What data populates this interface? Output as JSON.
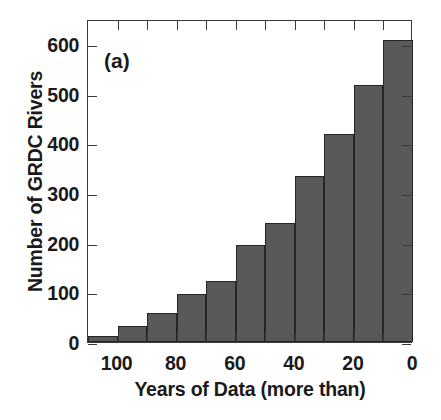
{
  "chart_data": {
    "type": "bar",
    "title": "",
    "panel_label": "(a)",
    "xlabel": "Years of Data (more than)",
    "ylabel": "Number of GRDC Rivers",
    "grid": false,
    "legend": "none",
    "xlim": [
      110,
      0
    ],
    "ylim": [
      0,
      650
    ],
    "x_reversed": true,
    "xticks": [
      100,
      80,
      60,
      40,
      20,
      0
    ],
    "xtick_labels": [
      "100",
      "80",
      "60",
      "40",
      "20",
      "0"
    ],
    "yticks": [
      0,
      100,
      200,
      300,
      400,
      500,
      600
    ],
    "ytick_labels": [
      "0",
      "100",
      "200",
      "300",
      "400",
      "500",
      "600"
    ],
    "bar_color": "#595959",
    "bar_edge_color": "#262626",
    "axis_color": "#3a3a3a",
    "bin_width": 10,
    "bin_edges": [
      110,
      100,
      90,
      80,
      70,
      60,
      50,
      40,
      30,
      20,
      10,
      0
    ],
    "categories": [
      "110-100",
      "100-90",
      "90-80",
      "80-70",
      "70-60",
      "60-50",
      "50-40",
      "40-30",
      "30-20",
      "20-10",
      "10-0"
    ],
    "bin_centers": [
      105,
      95,
      85,
      75,
      65,
      55,
      45,
      35,
      25,
      15,
      5
    ],
    "values": [
      12,
      32,
      58,
      97,
      122,
      195,
      240,
      335,
      418,
      518,
      608
    ]
  }
}
